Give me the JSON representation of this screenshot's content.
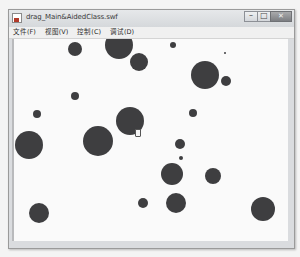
{
  "window": {
    "title": "drag_Main&AidedClass.swf",
    "controls": {
      "minimize": "–",
      "maximize": "□",
      "close": "✕"
    }
  },
  "menubar": {
    "items": [
      {
        "label": "文件(F)"
      },
      {
        "label": "视图(V)"
      },
      {
        "label": "控制(C)"
      },
      {
        "label": "调试(D)"
      }
    ]
  },
  "stage": {
    "ball_color": "#3e3e40",
    "background": "#fafafa",
    "balls": [
      {
        "x": 73,
        "y": 49,
        "r": 7
      },
      {
        "x": 117,
        "y": 45,
        "r": 14
      },
      {
        "x": 137,
        "y": 62,
        "r": 9
      },
      {
        "x": 171,
        "y": 45,
        "r": 3
      },
      {
        "x": 203,
        "y": 75,
        "r": 14
      },
      {
        "x": 223,
        "y": 53,
        "r": 1
      },
      {
        "x": 224,
        "y": 81,
        "r": 5
      },
      {
        "x": 73,
        "y": 96,
        "r": 4
      },
      {
        "x": 35,
        "y": 114,
        "r": 4
      },
      {
        "x": 191,
        "y": 113,
        "r": 4
      },
      {
        "x": 128,
        "y": 121,
        "r": 14
      },
      {
        "x": 96,
        "y": 141,
        "r": 15
      },
      {
        "x": 27,
        "y": 145,
        "r": 14
      },
      {
        "x": 178,
        "y": 144,
        "r": 5
      },
      {
        "x": 179,
        "y": 158,
        "r": 2
      },
      {
        "x": 170,
        "y": 174,
        "r": 11
      },
      {
        "x": 211,
        "y": 176,
        "r": 8
      },
      {
        "x": 141,
        "y": 203,
        "r": 5
      },
      {
        "x": 174,
        "y": 203,
        "r": 10
      },
      {
        "x": 37,
        "y": 213,
        "r": 10
      },
      {
        "x": 261,
        "y": 209,
        "r": 12
      }
    ],
    "cursor": {
      "x": 133,
      "y": 129
    }
  }
}
